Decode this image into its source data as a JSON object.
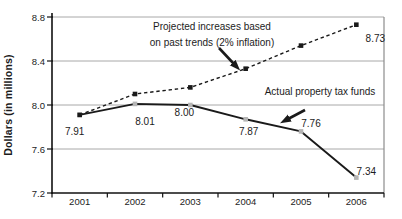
{
  "figure": {
    "background": "#ffffff"
  },
  "chart_data": {
    "type": "line",
    "title": "",
    "xlabel": "",
    "ylabel": "Dollars (in millions)",
    "categories": [
      "2001",
      "2002",
      "2003",
      "2004",
      "2005",
      "2006"
    ],
    "ylim": [
      7.2,
      8.8
    ],
    "y_ticks": [
      {
        "value": 7.2,
        "label": "7.2"
      },
      {
        "value": 7.6,
        "label": "7.6"
      },
      {
        "value": 8.0,
        "label": "8.0"
      },
      {
        "value": 8.4,
        "label": "8.4"
      },
      {
        "value": 8.8,
        "label": "8.8"
      }
    ],
    "grid": true,
    "legend_position": "none",
    "series": [
      {
        "name": "Projected increases based on past trends (2% inflation)",
        "line_style": "dashed",
        "marker": "black-square",
        "values": [
          7.91,
          8.1,
          8.16,
          8.33,
          8.54,
          8.73
        ],
        "point_labels": [
          "",
          "",
          "",
          "",
          "",
          "8.73"
        ],
        "label_offsets": [
          [
            0,
            0
          ],
          [
            0,
            0
          ],
          [
            0,
            0
          ],
          [
            0,
            0
          ],
          [
            0,
            0
          ],
          [
            19,
            17
          ]
        ]
      },
      {
        "name": "Actual property tax funds",
        "line_style": "solid",
        "marker": "gray-square",
        "values": [
          7.91,
          8.01,
          8.0,
          7.87,
          7.76,
          7.34
        ],
        "point_labels": [
          "7.91",
          "8.01",
          "8.00",
          "7.87",
          "7.76",
          "7.34"
        ],
        "label_offsets": [
          [
            -5,
            20
          ],
          [
            10,
            21
          ],
          [
            -6,
            11
          ],
          [
            3,
            16
          ],
          [
            10,
            -4
          ],
          [
            10,
            -3
          ]
        ]
      }
    ],
    "annotations": [
      {
        "lines": [
          "Projected increases based",
          "on past trends (2% inflation)"
        ],
        "target_series": "projected",
        "arrow": {
          "x1": 219,
          "y1": 48,
          "x2": 234,
          "y2": 64
        }
      },
      {
        "lines": [
          "Actual property tax funds"
        ],
        "target_series": "actual",
        "arrow": {
          "x1": 305,
          "y1": 110,
          "x2": 288,
          "y2": 119
        }
      }
    ],
    "colors": {
      "line": "#1a1a1a",
      "axis": "#111111",
      "grid": "#a8a8a8",
      "right_border": "#8c8c8c",
      "text": "#1c1c1c",
      "gray_marker": "#b5b5b5"
    }
  }
}
